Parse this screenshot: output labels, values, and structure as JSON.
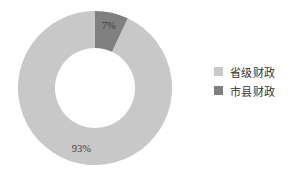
{
  "chart_data": {
    "type": "pie",
    "variant": "donut",
    "title": "",
    "subtitle": "",
    "xlabel": "",
    "ylabel": "",
    "grid": false,
    "legend_position": "right",
    "hole_ratio": 0.52,
    "start_angle_deg": 90,
    "direction": "counterclockwise",
    "categories": [
      "省级财政",
      "市县财政"
    ],
    "values": [
      93,
      7
    ],
    "value_unit": "%",
    "data_labels": [
      "93%",
      "7%"
    ],
    "colors": [
      "#c8c8c8",
      "#808080"
    ],
    "slices": [
      {
        "name": "省级财政",
        "value": 93,
        "label": "93%",
        "color": "#c8c8c8"
      },
      {
        "name": "市县财政",
        "value": 7,
        "label": "7%",
        "color": "#808080"
      }
    ]
  },
  "legend": {
    "items": [
      {
        "label": "省级财政",
        "color": "#c8c8c8"
      },
      {
        "label": "市县财政",
        "color": "#808080"
      }
    ]
  },
  "colors": {
    "background": "#ffffff",
    "label_text": "#3c3c3c",
    "legend_text": "#333333"
  }
}
